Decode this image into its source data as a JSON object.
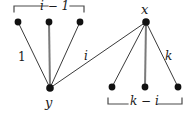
{
  "figure": {
    "background_color": "#ffffff",
    "node_color": "#111111",
    "edge_color": "#3a3a3a",
    "thick_edge_color": "#7a7a7a",
    "bracket_color": "#4a4a4a"
  },
  "labels": {
    "vertex_x": "x",
    "vertex_y": "y",
    "edge_first": "1",
    "edge_i": "i",
    "edge_k": "k",
    "bracket_top": "i − 1",
    "bracket_bottom": "k − i"
  },
  "nodes": [
    {
      "name": "top-left-node-1",
      "x": 18,
      "y": 22,
      "r": 3.4
    },
    {
      "name": "top-left-node-2",
      "x": 49,
      "y": 22,
      "r": 3.4
    },
    {
      "name": "top-left-node-3",
      "x": 80,
      "y": 22,
      "r": 3.4
    },
    {
      "name": "vertex-y",
      "x": 50,
      "y": 88,
      "r": 3.8
    },
    {
      "name": "vertex-x",
      "x": 146,
      "y": 22,
      "r": 3.8
    },
    {
      "name": "bottom-right-node-1",
      "x": 112,
      "y": 87,
      "r": 3.4
    },
    {
      "name": "bottom-right-node-2",
      "x": 145,
      "y": 87,
      "r": 3.4
    },
    {
      "name": "bottom-right-node-3",
      "x": 178,
      "y": 87,
      "r": 3.4
    }
  ],
  "edges": [
    {
      "name": "edge-y-to-top-left-1",
      "x1": 50,
      "y1": 88,
      "x2": 18,
      "y2": 22,
      "weight": "thin"
    },
    {
      "name": "edge-y-to-top-left-2",
      "x1": 50,
      "y1": 88,
      "x2": 49,
      "y2": 22,
      "weight": "thick"
    },
    {
      "name": "edge-y-to-top-left-3",
      "x1": 50,
      "y1": 88,
      "x2": 80,
      "y2": 22,
      "weight": "thin"
    },
    {
      "name": "edge-y-to-x",
      "x1": 50,
      "y1": 88,
      "x2": 146,
      "y2": 22,
      "weight": "thin"
    },
    {
      "name": "edge-x-to-bottom-right-1",
      "x1": 146,
      "y1": 22,
      "x2": 112,
      "y2": 87,
      "weight": "thin"
    },
    {
      "name": "edge-x-to-bottom-right-2",
      "x1": 146,
      "y1": 22,
      "x2": 145,
      "y2": 87,
      "weight": "thick"
    },
    {
      "name": "edge-x-to-bottom-right-3",
      "x1": 146,
      "y1": 22,
      "x2": 178,
      "y2": 87,
      "weight": "thin"
    }
  ],
  "brackets": [
    {
      "name": "bracket-top",
      "x_start": 14,
      "x_end": 84,
      "y_bar": 6,
      "tick": 6,
      "direction": "down"
    },
    {
      "name": "bracket-bottom",
      "x_start": 108,
      "x_end": 182,
      "y_bar": 104,
      "tick": 6,
      "direction": "up"
    }
  ]
}
